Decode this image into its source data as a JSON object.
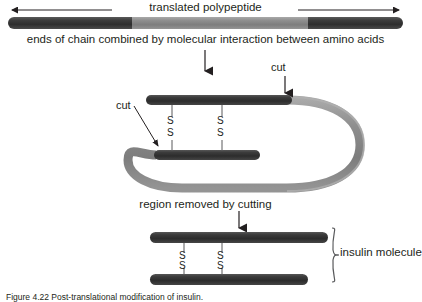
{
  "figure": {
    "domain": "Diagram",
    "subject": "Post-translational modification of insulin",
    "caption": "Figure 4.22 Post-translational modification of insulin."
  },
  "labels": {
    "translated_polypeptide": "translated polypeptide",
    "ends_of_chain": "ends of chain combined by molecular interaction between amino acids",
    "cut_right": "cut",
    "cut_left": "cut",
    "region_removed": "region removed by cutting",
    "insulin_molecule": "insulin molecule",
    "disulfide_top": "S",
    "disulfide_bottom": "S"
  },
  "colors": {
    "chain_dark": "#3a3a3a",
    "chain_light": "#8c8c8c",
    "chain_darkest": "#2b2b2b",
    "text": "#231f20",
    "line": "#58595b",
    "background": "#ffffff"
  },
  "stage1": {
    "name": "translated-polypeptide-bar",
    "segments": [
      {
        "name": "n-terminal-dark-segment",
        "color": "#3a3a3a",
        "x": 8,
        "width": 124
      },
      {
        "name": "central-light-segment",
        "color": "#8c8c8c",
        "x": 132,
        "width": 176
      },
      {
        "name": "c-terminal-dark-segment",
        "color": "#3a3a3a",
        "x": 308,
        "width": 95
      }
    ],
    "measure_arrow": {
      "x1": 10,
      "x2": 401,
      "y": 10
    }
  },
  "stage2": {
    "name": "folded-chain-with-disulfide-bonds",
    "disulfide_bonds": [
      {
        "name": "disulfide-bond-1",
        "x": 172
      },
      {
        "name": "disulfide-bond-2",
        "x": 222
      }
    ],
    "chains": [
      {
        "name": "upper-dark-chain",
        "x1": 146,
        "x2": 290,
        "y": 100
      },
      {
        "name": "lower-dark-chain",
        "x1": 154,
        "x2": 258,
        "y": 155
      }
    ],
    "connecting_loop": {
      "name": "c-peptide-light-loop",
      "color": "#8c8c8c"
    }
  },
  "stage3": {
    "name": "mature-insulin-molecule",
    "chains": [
      {
        "name": "a-chain-bar",
        "x1": 150,
        "x2": 328,
        "y": 235
      },
      {
        "name": "b-chain-bar",
        "x1": 150,
        "x2": 308,
        "y": 278
      }
    ],
    "disulfide_bonds": [
      {
        "name": "disulfide-bond-1",
        "x": 184
      },
      {
        "name": "disulfide-bond-2",
        "x": 222
      }
    ],
    "brace": {
      "name": "insulin-brace",
      "x": 332,
      "y1": 228,
      "y2": 288
    }
  }
}
